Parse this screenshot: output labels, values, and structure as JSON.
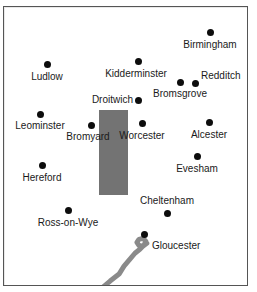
{
  "figure": {
    "kind": "reference-map",
    "width": 257,
    "height": 292,
    "background_color": "#ffffff",
    "frame_color": "#555555"
  },
  "map": {
    "marker_color": "#0d0d0d",
    "label_color": "#1a1a1a",
    "region_block_color": "#737373",
    "river_color": "#8a8a8a",
    "region_block": {
      "x": 99,
      "y": 110,
      "width": 29,
      "height": 85
    },
    "river": {
      "name": "river-estuary",
      "path": "M 104 289 L 111 283 L 120 276 L 125 268 L 131 261 L 136 255 L 141 251 L 145 247 L 147 243 L 144 240 L 140 241 L 138 244 L 140 247 L 144 248 L 148 245"
    },
    "cities": [
      {
        "name": "Birmingham",
        "dot": {
          "x": 210,
          "y": 32
        },
        "label": {
          "x": 210,
          "y": 39,
          "align": "center"
        }
      },
      {
        "name": "Ludlow",
        "dot": {
          "x": 47,
          "y": 64
        },
        "label": {
          "x": 47,
          "y": 71,
          "align": "center"
        }
      },
      {
        "name": "Kidderminster",
        "dot": {
          "x": 138,
          "y": 61
        },
        "label": {
          "x": 136,
          "y": 68,
          "align": "center"
        }
      },
      {
        "name": "Redditch",
        "dot": {
          "x": 195,
          "y": 83
        },
        "label": {
          "x": 201,
          "y": 70,
          "align": "left"
        }
      },
      {
        "name": "Bromsgrove",
        "dot": {
          "x": 180,
          "y": 82
        },
        "label": {
          "x": 180,
          "y": 88,
          "align": "center"
        }
      },
      {
        "name": "Droitwich",
        "dot": {
          "x": 138,
          "y": 100
        },
        "label": {
          "x": 133,
          "y": 94,
          "align": "right"
        }
      },
      {
        "name": "Leominster",
        "dot": {
          "x": 40,
          "y": 114
        },
        "label": {
          "x": 40,
          "y": 120,
          "align": "center"
        }
      },
      {
        "name": "Bromyard",
        "dot": {
          "x": 91,
          "y": 125
        },
        "label": {
          "x": 88,
          "y": 131,
          "align": "center"
        }
      },
      {
        "name": "Worcester",
        "dot": {
          "x": 142,
          "y": 123
        },
        "label": {
          "x": 142,
          "y": 130,
          "align": "center"
        }
      },
      {
        "name": "Alcester",
        "dot": {
          "x": 209,
          "y": 122
        },
        "label": {
          "x": 209,
          "y": 129,
          "align": "center"
        }
      },
      {
        "name": "Evesham",
        "dot": {
          "x": 197,
          "y": 156
        },
        "label": {
          "x": 197,
          "y": 163,
          "align": "center"
        }
      },
      {
        "name": "Hereford",
        "dot": {
          "x": 42,
          "y": 165
        },
        "label": {
          "x": 42,
          "y": 172,
          "align": "center"
        }
      },
      {
        "name": "Cheltenham",
        "dot": {
          "x": 167,
          "y": 213
        },
        "label": {
          "x": 167,
          "y": 195,
          "align": "center"
        }
      },
      {
        "name": "Ross-on-Wye",
        "dot": {
          "x": 68,
          "y": 210
        },
        "label": {
          "x": 68,
          "y": 217,
          "align": "center"
        }
      },
      {
        "name": "Gloucester",
        "dot": {
          "x": 144,
          "y": 234
        },
        "label": {
          "x": 152,
          "y": 240,
          "align": "left"
        }
      }
    ]
  }
}
